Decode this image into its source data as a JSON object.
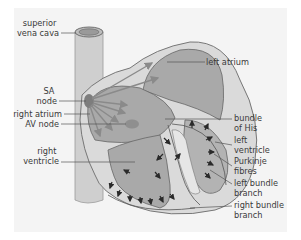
{
  "diagram": {
    "colors": {
      "panel_bg": "#f4f4f4",
      "vessel_fill": "#cfcfcf",
      "heart_outer": "#d6d6d6",
      "chamber_fill": "#a9a9a9",
      "wall_fill": "#c4c4c4",
      "node_fill": "#7d7d7d",
      "arrow_grey": "#8a8a8a",
      "arrow_dark": "#2a2a2a",
      "line": "#555555",
      "text": "#3a3a3a"
    },
    "labels_left": [
      {
        "id": "superior-vena-cava",
        "lines": [
          "superior",
          "vena cava"
        ]
      },
      {
        "id": "sa-node",
        "lines": [
          "SA",
          "node"
        ]
      },
      {
        "id": "right-atrium",
        "lines": [
          "right atrium"
        ]
      },
      {
        "id": "av-node",
        "lines": [
          "AV node"
        ]
      },
      {
        "id": "right-ventricle",
        "lines": [
          "right",
          "ventricle"
        ]
      }
    ],
    "labels_right": [
      {
        "id": "left-atrium",
        "lines": [
          "left atrium"
        ]
      },
      {
        "id": "bundle-of-his",
        "lines": [
          "bundle",
          "of His"
        ]
      },
      {
        "id": "left-ventricle",
        "lines": [
          "left",
          "ventricle"
        ]
      },
      {
        "id": "purkinje-fibres",
        "lines": [
          "Purkinje",
          "fibres"
        ]
      },
      {
        "id": "left-bundle-branch",
        "lines": [
          "left bundle",
          "branch"
        ]
      },
      {
        "id": "right-bundle-branch",
        "lines": [
          "right bundle",
          "branch"
        ]
      }
    ]
  }
}
